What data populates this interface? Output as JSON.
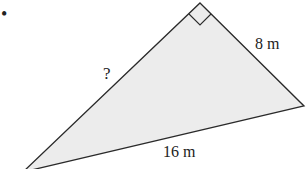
{
  "problem": {
    "bullet": "•"
  },
  "triangle": {
    "fill_color": "#ececec",
    "stroke_color": "#2a2a2a",
    "vertices": {
      "right_angle": [
        200,
        3
      ],
      "right": [
        304,
        106
      ],
      "bottom_left": [
        23,
        172
      ]
    },
    "right_angle_marker": true,
    "labels": {
      "hypotenuse_unknown": "?",
      "leg": "8 m",
      "base": "16 m"
    }
  }
}
